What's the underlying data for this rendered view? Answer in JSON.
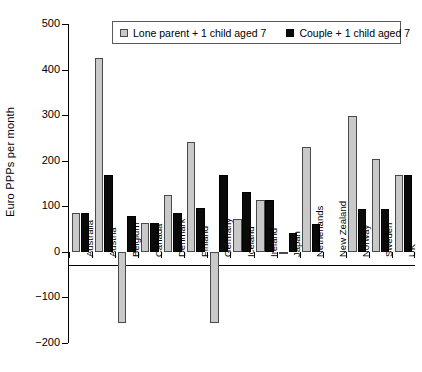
{
  "chart_data": {
    "type": "bar",
    "title": "",
    "xlabel": "",
    "ylabel": "Euro PPPs per month",
    "ylim": [
      -200,
      500
    ],
    "yticks": [
      500,
      400,
      300,
      200,
      100,
      0,
      -100,
      -200
    ],
    "ytick_labels": [
      "500",
      "400",
      "300",
      "200",
      "100",
      "0",
      "-100",
      "-200"
    ],
    "grid": false,
    "legend_position": "top-center",
    "categories": [
      "Australia",
      "Austria",
      "Belgium",
      "Canada",
      "Denmark",
      "Finland",
      "Germany",
      "Iceland",
      "Ireland",
      "Japan",
      "Netherlands",
      "New Zealand",
      "Norway",
      "Sweden",
      "UK"
    ],
    "series": [
      {
        "name": "Lone parent + 1 child aged 7",
        "color": "#c9c9c9",
        "values": [
          85,
          425,
          -157,
          63,
          125,
          241,
          -157,
          72,
          113,
          -5,
          229,
          0,
          299,
          203,
          168
        ]
      },
      {
        "name": "Couple + 1 child aged 7",
        "color": "#0a0a0a",
        "values": [
          86,
          168,
          78,
          63,
          85,
          97,
          168,
          131,
          113,
          42,
          62,
          0,
          95,
          95,
          168
        ]
      }
    ]
  },
  "legend": {
    "items": [
      {
        "label": "Lone parent + 1 child aged 7",
        "swatch": "gray"
      },
      {
        "label": "Couple + 1 child aged 7",
        "swatch": "black"
      }
    ]
  },
  "axis": {
    "y_title": "Euro PPPs per month"
  }
}
